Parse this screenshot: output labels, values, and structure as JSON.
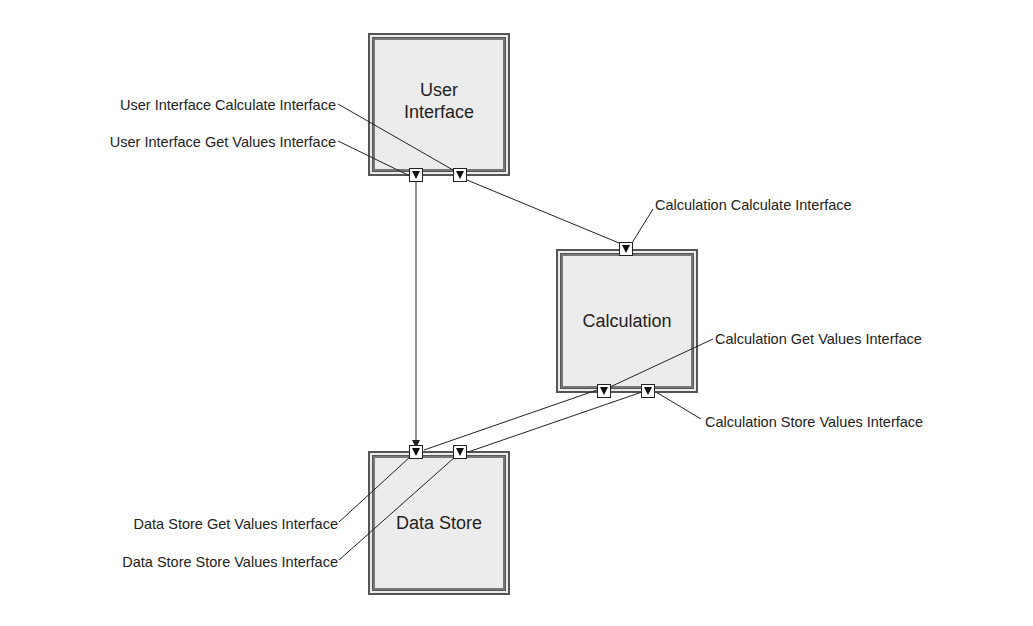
{
  "diagram": {
    "type": "component-interface-diagram",
    "components": [
      {
        "id": "user_interface",
        "label_line1": "User",
        "label_line2": "Interface"
      },
      {
        "id": "calculation",
        "label": "Calculation"
      },
      {
        "id": "data_store",
        "label": "Data Store"
      }
    ],
    "interfaces": [
      {
        "id": "ui_calculate",
        "label": "User Interface Calculate Interface",
        "owner": "user_interface"
      },
      {
        "id": "ui_get_values",
        "label": "User Interface Get Values Interface",
        "owner": "user_interface"
      },
      {
        "id": "calc_calculate",
        "label": "Calculation Calculate Interface",
        "owner": "calculation"
      },
      {
        "id": "calc_get_values",
        "label": "Calculation Get Values Interface",
        "owner": "calculation"
      },
      {
        "id": "calc_store_values",
        "label": "Calculation Store Values Interface",
        "owner": "calculation"
      },
      {
        "id": "ds_get_values",
        "label": "Data Store Get Values Interface",
        "owner": "data_store"
      },
      {
        "id": "ds_store_values",
        "label": "Data Store Store Values Interface",
        "owner": "data_store"
      }
    ],
    "connections": [
      {
        "from": "ui_calculate",
        "to": "calc_calculate"
      },
      {
        "from": "ui_get_values",
        "to": "ds_get_values"
      },
      {
        "from": "calc_get_values",
        "to": "ds_get_values"
      },
      {
        "from": "calc_store_values",
        "to": "ds_store_values"
      }
    ],
    "colors": {
      "box_fill": "#ececec",
      "box_border": "#555555",
      "line": "#222222",
      "port_fill": "#ffffff",
      "port_marker": "#111111"
    }
  }
}
